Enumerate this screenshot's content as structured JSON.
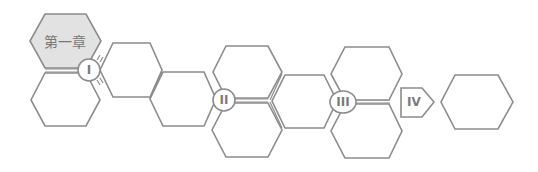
{
  "diagram": {
    "chapter_label": "第一章",
    "stages": [
      {
        "id": "stage-1",
        "label": "I"
      },
      {
        "id": "stage-2",
        "label": "II"
      },
      {
        "id": "stage-3",
        "label": "III"
      },
      {
        "id": "stage-4",
        "label": "IV"
      }
    ],
    "colors": {
      "stroke": "#8c8c8c",
      "highlight_fill": "#e2e2e2",
      "text": "#777777"
    }
  }
}
